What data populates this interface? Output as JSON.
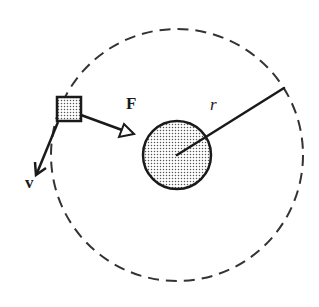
{
  "diagram": {
    "type": "physics-free-body",
    "labels": {
      "force": "F",
      "velocity": "v",
      "radius": "r"
    },
    "colors": {
      "stroke": "#1a1a1a",
      "dashed_orbit": "#333333",
      "stipple_fill": "#555555",
      "background": "#ffffff"
    },
    "orbit": {
      "cx": 177,
      "cy": 155,
      "r": 126,
      "style": "dashed"
    },
    "central_body": {
      "cx": 177,
      "cy": 155,
      "r": 34,
      "fill": "stippled"
    },
    "orbiting_object": {
      "shape": "square",
      "x": 57,
      "y": 97,
      "size": 24,
      "fill": "stippled"
    },
    "force_arrow": {
      "from": [
        81,
        115
      ],
      "to": [
        133,
        134
      ],
      "head": "hollow-triangle"
    },
    "velocity_arrow": {
      "from": [
        58,
        122
      ],
      "to": [
        36,
        175
      ],
      "head": "open-v"
    },
    "radius_line": {
      "from": [
        177,
        155
      ],
      "to": [
        284,
        88
      ]
    }
  }
}
